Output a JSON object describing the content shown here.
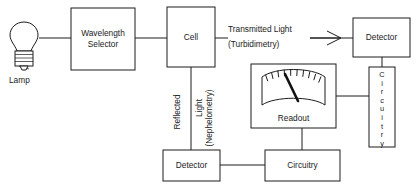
{
  "diagram": {
    "ink_color": "#1c1c1c",
    "background_color": "#ffffff",
    "nodes": {
      "lamp": {
        "label": "Lamp",
        "icon": "light-bulb-icon"
      },
      "wavelength_selector": {
        "label_line1": "Wavelength",
        "label_line2": "Selector"
      },
      "cell": {
        "label": "Cell"
      },
      "detector_top": {
        "label": "Detector"
      },
      "detector_bottom": {
        "label": "Detector"
      },
      "circuitry_vertical": {
        "label": "Circuitry",
        "letters": [
          "C",
          "i",
          "r",
          "c",
          "u",
          "i",
          "t",
          "r",
          "y"
        ]
      },
      "circuitry_bottom": {
        "label": "Circuitry"
      },
      "readout": {
        "label": "Readout",
        "icon": "analog-meter-icon",
        "tick_count": 10
      }
    },
    "labels": {
      "transmitted_line1": "Transmitted Light",
      "transmitted_line2": "(Turbidimetry)",
      "reflected_word": "Reflected",
      "nephelometry_line1": "Light",
      "nephelometry_line2": "(Nephelometry)"
    },
    "arrows": {
      "transmitted_arrow": "right-arrow-icon"
    }
  }
}
